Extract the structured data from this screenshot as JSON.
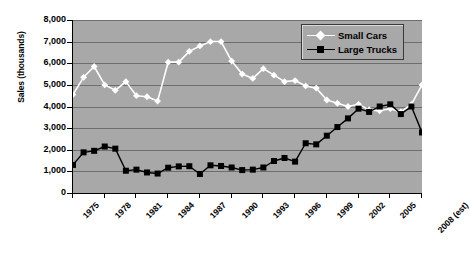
{
  "chart_data": {
    "type": "line",
    "title": "",
    "xlabel": "",
    "ylabel": "Sales (thousands)",
    "ylim": [
      0,
      8000
    ],
    "ytick_labels": [
      "8,000",
      "7,000",
      "6,000",
      "5,000",
      "4,000",
      "3,000",
      "2,000",
      "1,000",
      "0"
    ],
    "ytick_values": [
      8000,
      7000,
      6000,
      5000,
      4000,
      3000,
      2000,
      1000,
      0
    ],
    "grid": true,
    "legend_position": "top-right",
    "xtick_labels": [
      "1975",
      "1978",
      "1981",
      "1984",
      "1987",
      "1990",
      "1993",
      "1996",
      "1999",
      "2002",
      "2005",
      "2008 (est)"
    ],
    "xtick_values": [
      1975,
      1978,
      1981,
      1984,
      1987,
      1990,
      1993,
      1996,
      1999,
      2002,
      2005,
      2008
    ],
    "x": [
      1975,
      1976,
      1977,
      1978,
      1979,
      1980,
      1981,
      1982,
      1983,
      1984,
      1985,
      1986,
      1987,
      1988,
      1989,
      1990,
      1991,
      1992,
      1993,
      1994,
      1995,
      1996,
      1997,
      1998,
      1999,
      2000,
      2001,
      2002,
      2003,
      2004,
      2005,
      2006,
      2007,
      2008
    ],
    "xlim": [
      1975,
      2008
    ],
    "series": [
      {
        "name": "Small Cars",
        "color": "#ffffff",
        "marker": "diamond",
        "values": [
          4550,
          5350,
          5850,
          5000,
          4750,
          5150,
          4500,
          4450,
          4250,
          6050,
          6050,
          6550,
          6800,
          7000,
          7000,
          6100,
          5500,
          5300,
          5750,
          5450,
          5150,
          5200,
          4950,
          4850,
          4300,
          4150,
          4000,
          4100,
          3850,
          3800,
          3900,
          3750,
          4100,
          5000
        ]
      },
      {
        "name": "Large Trucks",
        "color": "#000000",
        "marker": "square",
        "values": [
          1300,
          1880,
          1950,
          2150,
          2050,
          1030,
          1080,
          950,
          900,
          1170,
          1230,
          1240,
          880,
          1280,
          1250,
          1180,
          1060,
          1080,
          1180,
          1480,
          1620,
          1450,
          2300,
          2250,
          2650,
          3050,
          3450,
          3900,
          3750,
          4000,
          4100,
          3650,
          4000,
          2800
        ]
      }
    ]
  },
  "legend": {
    "items": [
      {
        "label": "Small Cars"
      },
      {
        "label": "Large Trucks"
      }
    ]
  }
}
